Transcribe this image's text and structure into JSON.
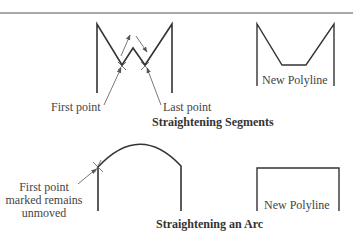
{
  "figure": {
    "top_section": {
      "caption": "Straightening Segments",
      "labels": {
        "first_point": "First point",
        "last_point": "Last point",
        "result": "New Polyline"
      }
    },
    "bottom_section": {
      "caption": "Straightening an Arc",
      "labels": {
        "first_point_line1": "First point",
        "first_point_line2": "marked remains",
        "first_point_line3": "unmoved",
        "result": "New Polyline"
      }
    }
  }
}
